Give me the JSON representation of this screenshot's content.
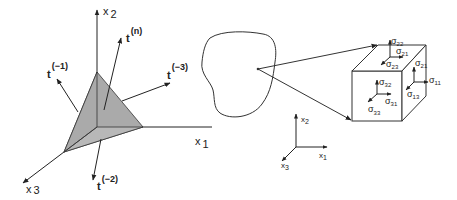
{
  "tetrahedron": {
    "axes": {
      "x1": {
        "base": "x",
        "sub": "1"
      },
      "x2": {
        "base": "x",
        "sub": "2"
      },
      "x3": {
        "base": "x",
        "sub": "3"
      }
    },
    "tractions": {
      "tn": {
        "base": "t",
        "sup": "(n)"
      },
      "t1": {
        "base": "t",
        "sup": "(−1)"
      },
      "t2": {
        "base": "t",
        "sup": "(−2)"
      },
      "t3": {
        "base": "t",
        "sup": "(−3)"
      }
    },
    "face_color": "#a8a8a8"
  },
  "body": {
    "description": "arbitrary body with point"
  },
  "small_axes": {
    "x1": {
      "base": "x",
      "sub": "1"
    },
    "x2": {
      "base": "x",
      "sub": "2"
    },
    "x3": {
      "base": "x",
      "sub": "3"
    }
  },
  "cube": {
    "top_face": {
      "up": "22",
      "right": "21",
      "diag": "23"
    },
    "right_face": {
      "up": "21",
      "right": "11",
      "diag": "13"
    },
    "front_face": {
      "up": "32",
      "right": "31",
      "diag": "33"
    },
    "sigma": "σ"
  }
}
